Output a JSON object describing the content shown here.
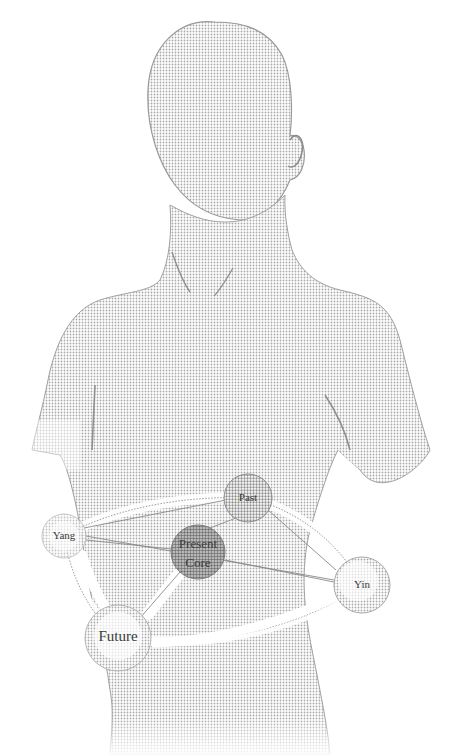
{
  "figure": {
    "style": "halftone stipple",
    "colors": {
      "background": "#ffffff",
      "body_fill": "#d9d9d9",
      "outline": "#9a9a9a",
      "node_fill": "#c8c8c8",
      "core_fill": "#a8a8a8",
      "ring_band": "#ffffff",
      "label": "#3a3a3a"
    }
  },
  "nodes": [
    {
      "id": "past",
      "label": "Past",
      "cx": 248,
      "cy": 498,
      "r": 24
    },
    {
      "id": "yang",
      "label": "Yang",
      "cx": 64,
      "cy": 536,
      "r": 22
    },
    {
      "id": "present_core",
      "label_line1": "Present",
      "label_line2": "Core",
      "cx": 198,
      "cy": 552,
      "r": 27
    },
    {
      "id": "yin",
      "label": "Yin",
      "cx": 362,
      "cy": 585,
      "r": 28
    },
    {
      "id": "future",
      "label": "Future",
      "cx": 118,
      "cy": 638,
      "r": 33
    }
  ],
  "connections": [
    {
      "from": "yang",
      "to": "past"
    },
    {
      "from": "past",
      "to": "yin"
    },
    {
      "from": "yin",
      "to": "future"
    },
    {
      "from": "future",
      "to": "yang"
    },
    {
      "from": "present_core",
      "to": "past"
    },
    {
      "from": "present_core",
      "to": "future"
    },
    {
      "from": "present_core",
      "to": "yin"
    },
    {
      "from": "present_core",
      "to": "yang"
    }
  ]
}
